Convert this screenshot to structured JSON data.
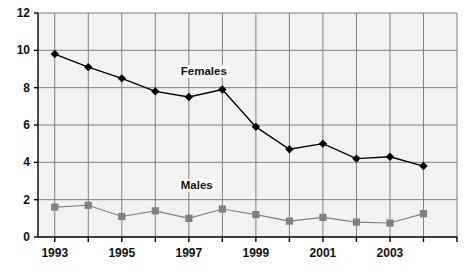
{
  "chart_data": {
    "type": "line",
    "title": "",
    "subtitle": "",
    "xlabel": "",
    "ylabel": "",
    "x": [
      1993,
      1994,
      1995,
      1996,
      1997,
      1998,
      1999,
      2000,
      2001,
      2002,
      2003,
      2004
    ],
    "categories": [
      "1993",
      "1994",
      "1995",
      "1996",
      "1997",
      "1998",
      "1999",
      "2000",
      "2001",
      "2002",
      "2003",
      "2004"
    ],
    "xtick_labels": [
      "1993",
      "1995",
      "1997",
      "1999",
      "2001",
      "2003"
    ],
    "xtick_values": [
      1993,
      1995,
      1997,
      1999,
      2001,
      2003
    ],
    "ytick_labels": [
      "0",
      "2",
      "4",
      "6",
      "8",
      "10",
      "12"
    ],
    "ytick_values": [
      0,
      2,
      4,
      6,
      8,
      10,
      12
    ],
    "ylim": [
      0,
      12
    ],
    "xlim": [
      1992.5,
      2005
    ],
    "grid": true,
    "legend_position": "inline-annotation",
    "series": [
      {
        "name": "Females",
        "color": "#000000",
        "marker": "diamond",
        "label_x": 1996.7,
        "label_y": 8.85,
        "values": [
          9.8,
          9.1,
          8.5,
          7.8,
          7.5,
          7.9,
          5.9,
          4.7,
          5.0,
          4.2,
          4.3,
          3.8
        ]
      },
      {
        "name": "Males",
        "color": "#808080",
        "marker": "square",
        "label_x": 1996.7,
        "label_y": 2.75,
        "values": [
          1.6,
          1.7,
          1.1,
          1.4,
          1.0,
          1.5,
          1.2,
          0.85,
          1.05,
          0.8,
          0.75,
          1.25
        ]
      }
    ],
    "annotations": [
      {
        "text": "Females",
        "x": 1996.7,
        "y": 8.85
      },
      {
        "text": "Males",
        "x": 1996.7,
        "y": 2.75
      }
    ],
    "colors": {
      "plot_background": "#f2f2f2",
      "grid": "#808080",
      "axis": "#000000",
      "females": "#000000",
      "males": "#808080",
      "page_background": "#ffffff"
    }
  }
}
